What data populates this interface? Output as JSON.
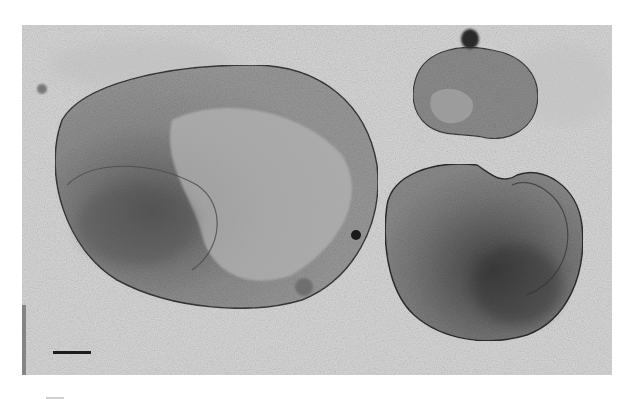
{
  "figure": {
    "type": "transmission electron micrograph",
    "colors": {
      "background": "#d6d6d6",
      "vesicle_fill": "#8a8a8a",
      "vesicle_dark": "#4a4a4a",
      "page": "#ffffff"
    },
    "scale_bar": {
      "label": ""
    }
  }
}
